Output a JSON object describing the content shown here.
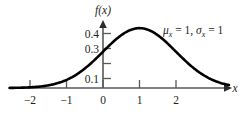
{
  "chart_data": {
    "type": "line",
    "title": "",
    "subtitle": "",
    "xlabel": "x",
    "ylabel": "f(x)",
    "xlim": [
      -2.55,
      3.45
    ],
    "ylim": [
      0,
      0.46
    ],
    "grid": false,
    "legend": null,
    "curve_name": "normal-pdf",
    "distribution": {
      "mean": 1,
      "sigma": 1,
      "peak_value": 0.399
    },
    "x_ticks": [
      {
        "value": -2,
        "label": "−2"
      },
      {
        "value": -1,
        "label": "−1"
      },
      {
        "value": 0,
        "label": "0"
      },
      {
        "value": 1,
        "label": "1"
      },
      {
        "value": 2,
        "label": "2"
      }
    ],
    "y_ticks": [
      {
        "value": 0.1,
        "label": "0.1"
      },
      {
        "value": 0.2,
        "label": ""
      },
      {
        "value": 0.3,
        "label": "0.3"
      },
      {
        "value": 0.4,
        "label": "0.4"
      }
    ],
    "x": [
      -2.5,
      -2.25,
      -2,
      -1.75,
      -1.5,
      -1.25,
      -1,
      -0.75,
      -0.5,
      -0.25,
      0,
      0.25,
      0.5,
      0.75,
      1,
      1.25,
      1.5,
      1.75,
      2,
      2.25,
      2.5,
      2.75,
      3,
      3.25
    ],
    "values": [
      0.0088,
      0.0145,
      0.0228,
      0.0347,
      0.0508,
      0.0721,
      0.0994,
      0.1315,
      0.1826,
      0.2298,
      0.242,
      0.3011,
      0.3521,
      0.3867,
      0.3989,
      0.3867,
      0.3521,
      0.3011,
      0.242,
      0.1826,
      0.1295,
      0.0863,
      0.054,
      0.0317
    ],
    "annotations": [
      {
        "name": "parameters",
        "mu_symbol": "μ",
        "mu_subscript": "x",
        "mu_equals": " = 1, ",
        "sigma_symbol": "σ",
        "sigma_subscript": "x",
        "sigma_equals": " = 1",
        "text": "μₓ = 1, σₓ = 1"
      }
    ],
    "colors": {
      "curve": "#000000",
      "axis": "#58595b",
      "text": "#231f20",
      "background": "#ffffff"
    }
  }
}
